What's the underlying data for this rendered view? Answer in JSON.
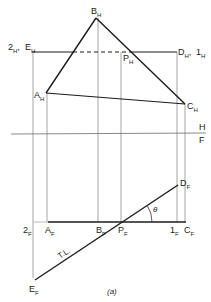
{
  "figure": {
    "caption": "(a)",
    "fold_line": {
      "upper": "H",
      "lower": "F"
    },
    "top_view": {
      "points": {
        "B": {
          "main": "B",
          "sub": "H"
        },
        "A": {
          "main": "A",
          "sub": "H"
        },
        "C": {
          "main": "C",
          "sub": "H"
        },
        "P": {
          "main": "P",
          "sub": "H"
        },
        "E": {
          "main": "E",
          "sub": "H"
        },
        "D": {
          "main": "D",
          "sub": "H"
        },
        "two": {
          "main": "2",
          "sub": "H"
        },
        "one": {
          "main": "1",
          "sub": "H"
        }
      },
      "separator": ","
    },
    "front_view": {
      "points": {
        "two": {
          "main": "2",
          "sub": "F"
        },
        "A": {
          "main": "A",
          "sub": "F"
        },
        "B": {
          "main": "B",
          "sub": "F"
        },
        "P": {
          "main": "P",
          "sub": "F"
        },
        "one": {
          "main": "1",
          "sub": "F"
        },
        "C": {
          "main": "C",
          "sub": "F"
        },
        "D": {
          "main": "D",
          "sub": "F"
        },
        "E": {
          "main": "E",
          "sub": "F"
        }
      },
      "true_length_label": "T.L.",
      "angle_label": "θ"
    }
  }
}
